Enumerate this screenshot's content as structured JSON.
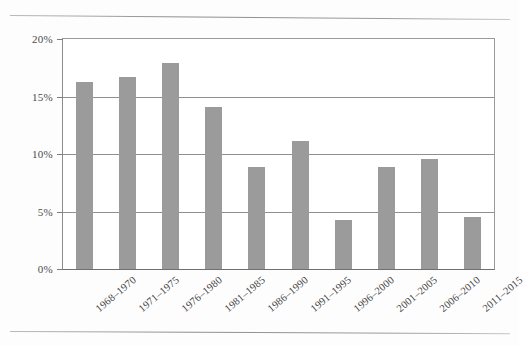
{
  "page": {
    "background_color": "#fdfdfd",
    "rule_color": "#9a9a9a",
    "has_top_rule": true,
    "has_bottom_rule": true
  },
  "figure": {
    "bar_color": "#9b9b9b",
    "gridline_color": "#8f8f8f",
    "axis_color": "#6f6f6f",
    "plot_background": "#ffffff"
  },
  "chart_data": {
    "type": "bar",
    "title": "",
    "subtitle": "",
    "xlabel": "",
    "ylabel": "",
    "categories": [
      "1968–1970",
      "1971–1975",
      "1976–1980",
      "1981–1985",
      "1986–1990",
      "1991–1995",
      "1996–2000",
      "2001–2005",
      "2006–2010",
      "2011–2015"
    ],
    "values": [
      16.3,
      16.7,
      17.9,
      14.1,
      8.9,
      11.1,
      4.3,
      8.9,
      9.6,
      4.5
    ],
    "value_unit": "%",
    "ylim": [
      0,
      20
    ],
    "yticks": [
      0,
      5,
      10,
      15,
      20
    ],
    "ytick_labels": [
      "0%",
      "5%",
      "10%",
      "15%",
      "20%"
    ],
    "grid": true,
    "grid_axis": "y",
    "legend": false,
    "legend_position": "none",
    "xtick_label_rotation": -40
  }
}
